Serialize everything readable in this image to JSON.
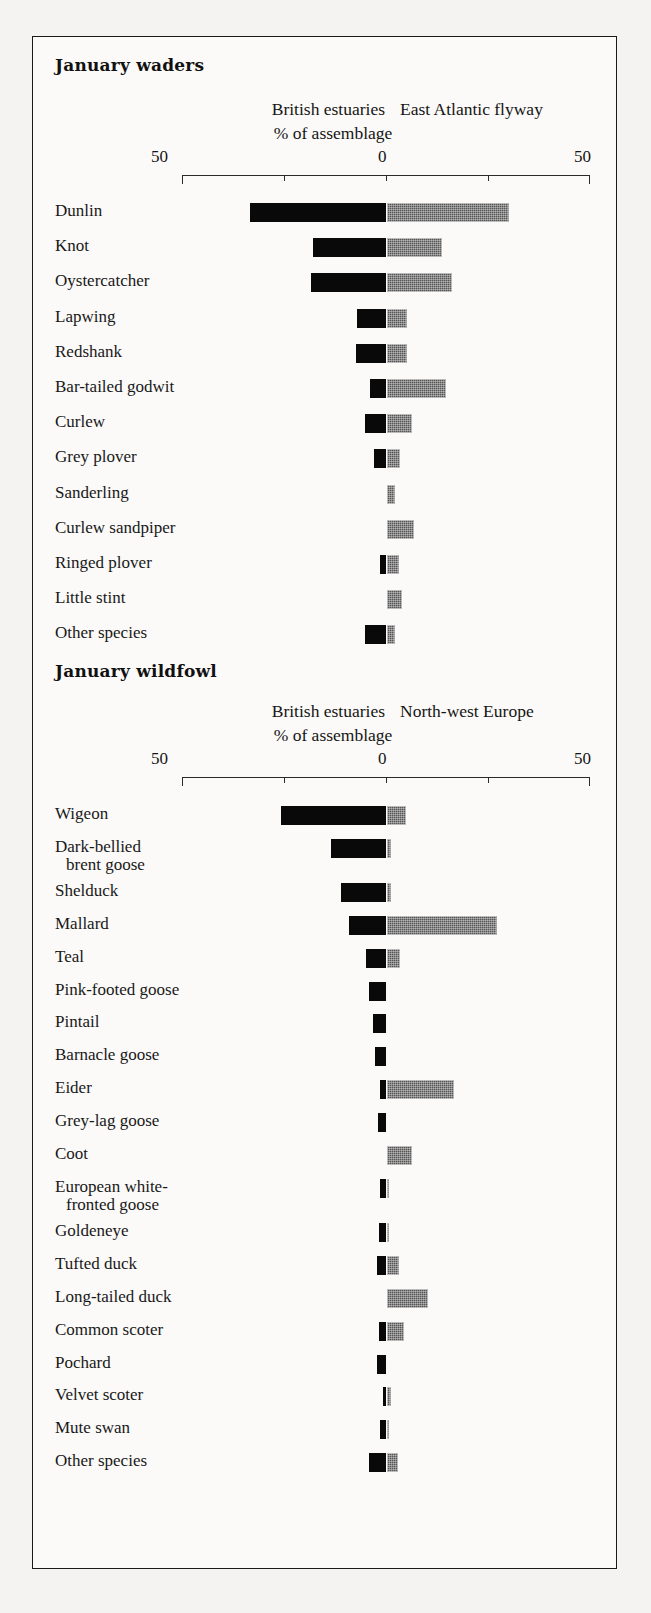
{
  "figure": {
    "background_color": "#f4f3f1",
    "frame_color": "#1a1a1a",
    "left_series_color": "#090909",
    "right_series_color": "#565656"
  },
  "chart_data": {
    "type": "bar",
    "orientation": "horizontal-diverging",
    "title": "",
    "xlabel": "% of assemblage",
    "ylabel": "",
    "xlim": [
      -50,
      50
    ],
    "axis_tick_labels": [
      "50",
      "0",
      "50"
    ],
    "axis_tick_values": [
      -50,
      0,
      50
    ],
    "minor_tick_values": [
      -25,
      25
    ],
    "grid": false,
    "legend_position": "top",
    "panels": [
      {
        "id": "january-waders",
        "title": "January waders",
        "left_label": "British estuaries",
        "right_label": "East Atlantic flyway",
        "axis_label": "% of assemblage",
        "categories": [
          "Dunlin",
          "Knot",
          "Oystercatcher",
          "Lapwing",
          "Redshank",
          "Bar-tailed godwit",
          "Curlew",
          "Grey plover",
          "Sanderling",
          "Curlew sandpiper",
          "Ringed plover",
          "Little stint",
          "Other species"
        ],
        "series": [
          {
            "name": "British estuaries",
            "values": [
              33.6,
              18.2,
              18.7,
              7.3,
              7.5,
              4.1,
              5.3,
              3.0,
              0.0,
              0.0,
              1.6,
              0.0,
              5.4
            ]
          },
          {
            "name": "East Atlantic flyway",
            "values": [
              30.1,
              13.7,
              16.2,
              5.1,
              5.0,
              14.6,
              6.3,
              3.3,
              2.1,
              6.8,
              3.1,
              3.8,
              2.1
            ]
          }
        ]
      },
      {
        "id": "january-wildfowl",
        "title": "January wildfowl",
        "left_label": "British estuaries",
        "right_label": "North-west Europe",
        "axis_label": "% of assemblage",
        "categories": [
          "Wigeon",
          "Dark-bellied|brent goose",
          "Shelduck",
          "Mallard",
          "Teal",
          "Pink-footed goose",
          "Pintail",
          "Barnacle goose",
          "Eider",
          "Grey-lag goose",
          "Coot",
          "European white-|fronted goose",
          "Goldeneye",
          "Tufted duck",
          "Long-tailed duck",
          "Common scoter",
          "Pochard",
          "Velvet scoter",
          "Mute swan",
          "Other species"
        ],
        "series": [
          {
            "name": "British estuaries",
            "values": [
              26.1,
              13.7,
              11.3,
              9.3,
              5.1,
              4.4,
              3.4,
              2.9,
              1.5,
              2.2,
              0.0,
              1.7,
              1.9,
              2.3,
              0.0,
              1.8,
              2.4,
              0.8,
              1.6,
              4.2
            ]
          },
          {
            "name": "North-west Europe",
            "values": [
              4.7,
              1.2,
              1.2,
              27.2,
              3.3,
              0.0,
              0.0,
              0.0,
              16.7,
              0.0,
              6.4,
              0.5,
              0.6,
              3.2,
              10.2,
              4.2,
              0.0,
              1.2,
              0.5,
              2.8
            ]
          }
        ]
      }
    ]
  }
}
